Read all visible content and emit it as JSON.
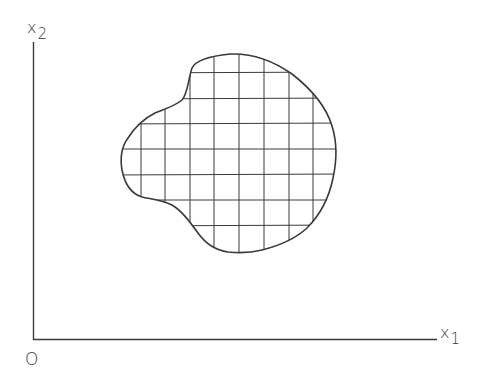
{
  "diagram": {
    "axes": {
      "y_label": {
        "main": "x",
        "sub": "2"
      },
      "x_label": {
        "main": "x",
        "sub": "1"
      },
      "origin_label": "O"
    },
    "region": {
      "description": "Irregular bounded region in the x1-x2 plane covered by a rectangular grid",
      "grid_vertical_lines_x": [
        141,
        165,
        190,
        214,
        239,
        264,
        289,
        313
      ],
      "grid_horizontal_lines_y": [
        73,
        99,
        124,
        149,
        175,
        200,
        226
      ]
    },
    "colors": {
      "line": "#3a3a3a",
      "background": "#ffffff"
    }
  }
}
